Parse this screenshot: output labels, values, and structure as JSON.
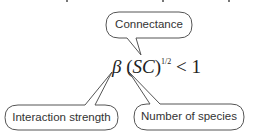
{
  "diagram": {
    "formula": {
      "beta": "β",
      "open_paren": " (",
      "SC": "SC",
      "close_paren": ")",
      "exponent": "1/2",
      "rest": " < 1"
    },
    "callouts": [
      {
        "id": "connectance",
        "label": "Connectance"
      },
      {
        "id": "interaction-strength",
        "label": "Interaction strength"
      },
      {
        "id": "number-of-species",
        "label": "Number of species"
      }
    ],
    "colors": {
      "bubble_stroke": "#555555",
      "bubble_fill": "#ffffff",
      "text": "#333333"
    }
  }
}
